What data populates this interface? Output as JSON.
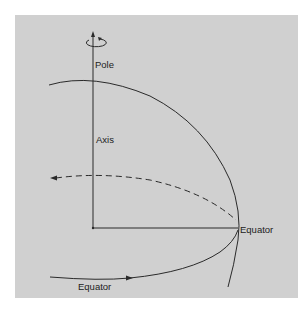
{
  "diagram": {
    "type": "earth-rotation-schematic",
    "labels": {
      "pole": "Pole",
      "axis": "Axis",
      "equator_right": "Equator",
      "equator_bottom": "Equator"
    },
    "icons": {
      "rotation": "rotation-arrow-icon",
      "axis_arrow": "arrow-up-icon",
      "dashed_arrow": "arrow-left-icon",
      "equator_arrow": "arrow-right-icon"
    },
    "colors": {
      "background": "#ffffff",
      "panel": "#d0d0d0",
      "stroke": "#2a2a2a",
      "text": "#222222"
    }
  }
}
